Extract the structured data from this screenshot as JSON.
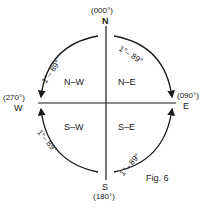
{
  "north": {
    "letter": "N",
    "bearing": "(000°)"
  },
  "east": {
    "letter": "E",
    "bearing": "(090°)"
  },
  "south": {
    "letter": "S",
    "bearing": "(180°)"
  },
  "west": {
    "letter": "W",
    "bearing": "(270°)"
  },
  "quadrants": {
    "nw": "N–W",
    "ne": "N–E",
    "sw": "S–W",
    "se": "S–E"
  },
  "arc_label": "1°– 89°",
  "caption": "Fig. 6"
}
